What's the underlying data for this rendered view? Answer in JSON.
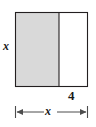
{
  "figure": {
    "type": "geometry-diagram",
    "labels": {
      "height": "x",
      "white_region_width": "4",
      "total_width": "x"
    },
    "colors": {
      "shaded_fill": "#d9d9d9",
      "unshaded_fill": "#ffffff",
      "stroke": "#231f20",
      "dimension_line": "#4d4d4d",
      "text": "#1a1a1a"
    },
    "geometry": {
      "rect_left": 15,
      "rect_right": 88,
      "rect_top": 12,
      "rect_bottom": 87,
      "divider_x": 59,
      "dimension_line_y": 112
    }
  }
}
